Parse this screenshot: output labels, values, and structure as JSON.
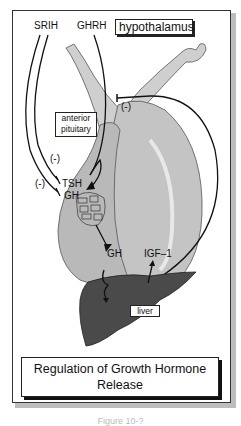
{
  "figure": {
    "title": "Regulation of Growth Hormone Release",
    "caption_partial": "Figure 10-?"
  },
  "labels": {
    "srih": "SRIH",
    "ghrh": "GHRH",
    "hypothalamus": "hypothalamus",
    "anterior_pituitary_line1": "anterior",
    "anterior_pituitary_line2": "pituitary",
    "inhibit_1": "(-)",
    "inhibit_2": "(-)",
    "inhibit_3": "(-)",
    "tsh": "TSH",
    "gh_pituitary": "GH",
    "gh_output": "GH",
    "igf1": "IGF–1",
    "liver": "liver"
  },
  "colors": {
    "pituitary_fill": "#c9c9c9",
    "pituitary_shade": "#a8a8a8",
    "liver_fill": "#4a4a4a",
    "line": "#111111"
  }
}
